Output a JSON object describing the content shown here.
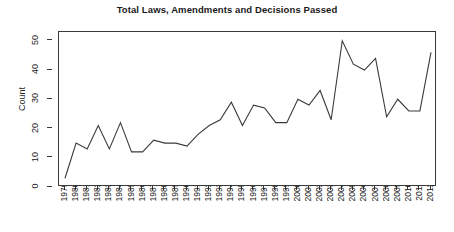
{
  "chart_data": {
    "type": "line",
    "title": "Total Laws, Amendments and Decisions Passed",
    "xlabel": "",
    "ylabel": "Count",
    "x": [
      1979,
      1980,
      1981,
      1982,
      1983,
      1984,
      1985,
      1986,
      1987,
      1988,
      1989,
      1990,
      1991,
      1992,
      1993,
      1994,
      1995,
      1996,
      1997,
      1998,
      1999,
      2000,
      2001,
      2002,
      2003,
      2004,
      2005,
      2006,
      2007,
      2008,
      2009,
      2010,
      2011,
      2012
    ],
    "categories": [
      "1979",
      "1980",
      "1981",
      "1982",
      "1983",
      "1984",
      "1985",
      "1986",
      "1987",
      "1988",
      "1989",
      "1990",
      "1991",
      "1992",
      "1993",
      "1994",
      "1995",
      "1996",
      "1997",
      "1998",
      "1999",
      "2000",
      "2001",
      "2002",
      "2003",
      "2004",
      "2005",
      "2006",
      "2007",
      "2008",
      "2009",
      "2010",
      "2011",
      "2012"
    ],
    "values": [
      3,
      15,
      13,
      21,
      13,
      22,
      12,
      12,
      16,
      15,
      15,
      14,
      18,
      21,
      23,
      29,
      21,
      28,
      27,
      22,
      22,
      30,
      28,
      33,
      23,
      50,
      42,
      40,
      44,
      24,
      30,
      26,
      26,
      46
    ],
    "series": [
      {
        "name": "Total Laws, Amendments and Decisions Passed",
        "values": [
          3,
          15,
          13,
          21,
          13,
          22,
          12,
          12,
          16,
          15,
          15,
          14,
          18,
          21,
          23,
          29,
          21,
          28,
          27,
          22,
          22,
          30,
          28,
          33,
          23,
          50,
          42,
          40,
          44,
          24,
          30,
          26,
          26,
          46
        ]
      }
    ],
    "ylim": [
      0,
      53
    ],
    "xlim": [
      1979,
      2012
    ],
    "yticks": [
      0,
      10,
      20,
      30,
      40,
      50
    ],
    "ytick_labels": [
      "0",
      "10",
      "20",
      "30",
      "40",
      "50"
    ],
    "xtick_labels": [
      "1979",
      "1980",
      "1981",
      "1982",
      "1983",
      "1984",
      "1985",
      "1986",
      "1987",
      "1988",
      "1989",
      "1990",
      "1991",
      "1992",
      "1993",
      "1994",
      "1995",
      "1996",
      "1997",
      "1998",
      "1999",
      "2000",
      "2001",
      "2002",
      "2003",
      "2004",
      "2005",
      "2006",
      "2007",
      "2008",
      "2009",
      "2010",
      "2011",
      "2012"
    ],
    "grid": false,
    "legend": false,
    "line_color": "#3a3a3a",
    "background_color": "#ffffff",
    "markers": false
  }
}
